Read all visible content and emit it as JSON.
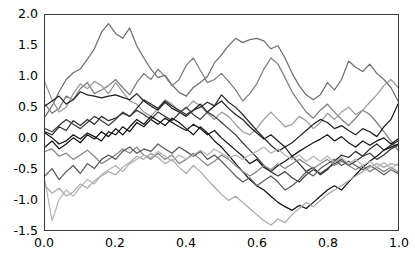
{
  "chart_data": {
    "type": "line",
    "title": "",
    "subtitle": "",
    "xlabel": "",
    "ylabel": "",
    "xlim": [
      0.0,
      1.0
    ],
    "ylim": [
      -1.5,
      2.0
    ],
    "grid": false,
    "legend": null,
    "legend_position": "none",
    "xticks": [
      "0.0",
      "0.2",
      "0.4",
      "0.6",
      "0.8",
      "1.0"
    ],
    "xtick_values": [
      0.0,
      0.2,
      0.4,
      0.6,
      0.8,
      1.0
    ],
    "yticks": [
      "2.0",
      "1.5",
      "1.0",
      "0.5",
      "0.0",
      "-0.5",
      "-1.0",
      "-1.5"
    ],
    "ytick_values": [
      2.0,
      1.5,
      1.0,
      0.5,
      0.0,
      -0.5,
      -1.0,
      -1.5
    ],
    "x": [
      0.0,
      0.02,
      0.04,
      0.06,
      0.08,
      0.1,
      0.12,
      0.14,
      0.16,
      0.18,
      0.2,
      0.22,
      0.24,
      0.26,
      0.28,
      0.3,
      0.32,
      0.34,
      0.36,
      0.38,
      0.4,
      0.42,
      0.44,
      0.46,
      0.48,
      0.5,
      0.52,
      0.54,
      0.56,
      0.58,
      0.6,
      0.62,
      0.64,
      0.66,
      0.68,
      0.7,
      0.72,
      0.74,
      0.76,
      0.78,
      0.8,
      0.82,
      0.84,
      0.86,
      0.88,
      0.9,
      0.92,
      0.94,
      0.96,
      0.98,
      1.0
    ],
    "series": [
      {
        "name": "sample-1",
        "color": "#6e6e6e",
        "values": [
          0.34,
          0.52,
          0.75,
          0.95,
          1.06,
          1.12,
          1.28,
          1.45,
          1.72,
          1.86,
          1.7,
          1.62,
          1.79,
          1.5,
          1.3,
          1.12,
          0.98,
          1.02,
          0.86,
          0.74,
          0.68,
          0.82,
          0.9,
          1.0,
          1.22,
          1.35,
          1.5,
          1.62,
          1.55,
          1.6,
          1.62,
          1.58,
          1.45,
          1.5,
          1.3,
          1.05,
          0.85,
          0.7,
          0.62,
          0.7,
          0.9,
          0.78,
          0.95,
          1.25,
          1.15,
          1.08,
          1.2,
          1.05,
          0.95,
          0.82,
          0.6
        ]
      },
      {
        "name": "sample-2",
        "color": "#7d7d7d",
        "values": [
          0.55,
          0.4,
          0.48,
          0.68,
          0.62,
          0.8,
          0.9,
          0.72,
          0.78,
          0.85,
          0.95,
          0.82,
          0.7,
          0.9,
          1.05,
          0.95,
          1.12,
          1.0,
          0.85,
          0.95,
          1.18,
          1.3,
          1.1,
          0.9,
          0.95,
          1.05,
          0.92,
          0.78,
          0.6,
          0.72,
          0.88,
          1.12,
          1.3,
          1.2,
          0.98,
          0.75,
          0.58,
          0.42,
          0.32,
          0.45,
          0.55,
          0.42,
          0.3,
          0.2,
          0.32,
          0.45,
          0.38,
          0.25,
          0.1,
          -0.05,
          -0.2
        ]
      },
      {
        "name": "sample-3",
        "color": "#9a9a9a",
        "values": [
          0.9,
          0.62,
          0.42,
          0.5,
          0.72,
          0.88,
          0.8,
          0.92,
          0.85,
          0.72,
          0.9,
          0.75,
          0.6,
          0.55,
          0.42,
          0.35,
          0.48,
          0.62,
          0.55,
          0.42,
          0.48,
          0.6,
          0.52,
          0.4,
          0.3,
          0.42,
          0.35,
          0.22,
          0.1,
          0.05,
          0.15,
          0.3,
          0.42,
          0.3,
          0.18,
          0.22,
          0.35,
          0.28,
          0.15,
          0.25,
          0.4,
          0.3,
          0.42,
          0.5,
          0.38,
          0.45,
          0.58,
          0.7,
          0.85,
          0.95,
          0.82
        ]
      },
      {
        "name": "sample-4",
        "color": "#1f1f1f",
        "values": [
          0.52,
          0.6,
          0.68,
          0.55,
          0.62,
          0.75,
          0.7,
          0.68,
          0.65,
          0.68,
          0.7,
          0.66,
          0.62,
          0.72,
          0.6,
          0.52,
          0.45,
          0.58,
          0.48,
          0.42,
          0.35,
          0.45,
          0.55,
          0.42,
          0.52,
          0.6,
          0.48,
          0.38,
          0.3,
          0.18,
          0.08,
          -0.02,
          0.05,
          -0.05,
          -0.15,
          -0.08,
          0.02,
          0.12,
          0.22,
          0.3,
          0.25,
          0.15,
          0.2,
          0.12,
          0.05,
          0.15,
          0.1,
          0.02,
          0.18,
          0.3,
          0.55
        ]
      },
      {
        "name": "sample-5",
        "color": "#2b2b2b",
        "values": [
          0.1,
          0.05,
          0.18,
          0.12,
          0.28,
          0.2,
          0.3,
          0.22,
          0.35,
          0.28,
          0.32,
          0.4,
          0.35,
          0.48,
          0.62,
          0.55,
          0.48,
          0.6,
          0.52,
          0.45,
          0.38,
          0.45,
          0.5,
          0.58,
          0.52,
          0.7,
          0.58,
          0.5,
          0.38,
          0.25,
          0.12,
          0.0,
          -0.12,
          -0.22,
          -0.15,
          -0.3,
          -0.42,
          -0.55,
          -0.48,
          -0.6,
          -0.52,
          -0.38,
          -0.28,
          -0.32,
          -0.22,
          -0.3,
          -0.18,
          -0.1,
          -0.2,
          -0.12,
          -0.05
        ]
      },
      {
        "name": "sample-6",
        "color": "#141414",
        "values": [
          0.08,
          0.0,
          -0.1,
          -0.05,
          0.05,
          -0.02,
          0.08,
          0.02,
          -0.05,
          0.1,
          0.05,
          0.18,
          0.1,
          0.25,
          0.18,
          0.3,
          0.22,
          0.32,
          0.25,
          0.18,
          0.12,
          0.22,
          0.15,
          0.05,
          0.12,
          0.0,
          -0.1,
          -0.2,
          -0.3,
          -0.42,
          -0.35,
          -0.48,
          -0.55,
          -0.45,
          -0.38,
          -0.3,
          -0.22,
          -0.15,
          -0.08,
          -0.02,
          0.05,
          -0.05,
          0.02,
          -0.08,
          -0.15,
          -0.05,
          -0.12,
          -0.05,
          0.0,
          -0.1,
          -0.02
        ]
      },
      {
        "name": "sample-7",
        "color": "#3d3d3d",
        "values": [
          0.15,
          0.1,
          0.2,
          0.3,
          0.22,
          0.15,
          0.25,
          0.35,
          0.28,
          0.2,
          0.3,
          0.42,
          0.35,
          0.45,
          0.38,
          0.3,
          0.42,
          0.35,
          0.28,
          0.4,
          0.5,
          0.38,
          0.3,
          0.42,
          0.35,
          0.25,
          0.15,
          0.05,
          -0.08,
          -0.2,
          -0.32,
          -0.45,
          -0.55,
          -0.62,
          -0.55,
          -0.65,
          -0.72,
          -0.6,
          -0.52,
          -0.58,
          -0.5,
          -0.42,
          -0.35,
          -0.45,
          -0.38,
          -0.3,
          -0.25,
          -0.35,
          -0.28,
          -0.18,
          -0.12
        ]
      },
      {
        "name": "sample-8",
        "color": "#0f0f0f",
        "values": [
          -0.15,
          -0.05,
          -0.18,
          -0.1,
          0.0,
          -0.08,
          0.05,
          -0.02,
          0.1,
          0.02,
          0.15,
          0.05,
          0.18,
          0.3,
          0.22,
          0.35,
          0.28,
          0.2,
          0.32,
          0.25,
          0.15,
          0.05,
          0.18,
          0.08,
          -0.05,
          -0.15,
          -0.28,
          -0.42,
          -0.55,
          -0.68,
          -0.78,
          -0.85,
          -0.95,
          -1.05,
          -1.12,
          -1.18,
          -1.1,
          -1.15,
          -1.05,
          -0.95,
          -0.85,
          -0.78,
          -0.85,
          -0.72,
          -0.6,
          -0.48,
          -0.38,
          -0.3,
          -0.2,
          -0.15,
          -0.1
        ]
      },
      {
        "name": "sample-9",
        "color": "#858585",
        "values": [
          -0.22,
          -0.18,
          -0.3,
          -0.25,
          -0.35,
          -0.28,
          -0.2,
          -0.3,
          -0.42,
          -0.35,
          -0.28,
          -0.18,
          -0.25,
          -0.15,
          -0.28,
          -0.35,
          -0.25,
          -0.35,
          -0.28,
          -0.42,
          -0.35,
          -0.25,
          -0.35,
          -0.45,
          -0.38,
          -0.28,
          -0.35,
          -0.45,
          -0.55,
          -0.62,
          -0.55,
          -0.45,
          -0.52,
          -0.42,
          -0.5,
          -0.42,
          -0.35,
          -0.42,
          -0.5,
          -0.42,
          -0.35,
          -0.45,
          -0.38,
          -0.45,
          -0.52,
          -0.45,
          -0.55,
          -0.48,
          -0.55,
          -0.48,
          -0.55
        ]
      },
      {
        "name": "sample-10",
        "color": "#5a5a5a",
        "values": [
          -0.62,
          -0.5,
          -0.68,
          -0.55,
          -0.45,
          -0.58,
          -0.42,
          -0.5,
          -0.35,
          -0.28,
          -0.35,
          -0.22,
          -0.15,
          -0.25,
          -0.18,
          -0.22,
          -0.1,
          -0.18,
          -0.25,
          -0.15,
          -0.22,
          -0.3,
          -0.22,
          -0.35,
          -0.28,
          -0.38,
          -0.5,
          -0.62,
          -0.72,
          -0.65,
          -0.78,
          -0.7,
          -0.62,
          -0.72,
          -0.85,
          -0.78,
          -0.68,
          -0.55,
          -0.62,
          -0.5,
          -0.42,
          -0.35,
          -0.45,
          -0.38,
          -0.45,
          -0.52,
          -0.45,
          -0.52,
          -0.6,
          -0.52,
          -0.58
        ]
      },
      {
        "name": "sample-11",
        "color": "#a8a8a8",
        "values": [
          -0.78,
          -0.9,
          -0.82,
          -0.95,
          -0.88,
          -0.75,
          -0.82,
          -0.7,
          -0.62,
          -0.55,
          -0.6,
          -0.48,
          -0.4,
          -0.3,
          -0.35,
          -0.25,
          -0.32,
          -0.42,
          -0.35,
          -0.48,
          -0.58,
          -0.45,
          -0.55,
          -0.68,
          -0.8,
          -0.92,
          -1.02,
          -0.95,
          -1.05,
          -1.15,
          -1.25,
          -1.35,
          -1.42,
          -1.32,
          -1.38,
          -1.25,
          -1.15,
          -1.05,
          -1.12,
          -1.02,
          -0.92,
          -0.85,
          -0.78,
          -0.7,
          -0.62,
          -0.55,
          -0.48,
          -0.42,
          -0.48,
          -0.42,
          -0.45
        ]
      },
      {
        "name": "sample-12",
        "color": "#b5b5b5",
        "values": [
          -0.7,
          -1.35,
          -1.0,
          -0.85,
          -0.95,
          -0.8,
          -0.68,
          -0.75,
          -0.6,
          -0.52,
          -0.45,
          -0.55,
          -0.42,
          -0.35,
          -0.28,
          -0.32,
          -0.22,
          -0.3,
          -0.38,
          -0.28,
          -0.35,
          -0.28,
          -0.2,
          -0.28,
          -0.18,
          -0.25,
          -0.32,
          -0.28,
          -0.35,
          -0.28,
          -0.22,
          -0.15,
          -0.25,
          -0.18,
          -0.28,
          -0.35,
          -0.28,
          -0.38,
          -0.3,
          -0.38,
          -0.3,
          -0.4,
          -0.32,
          -0.42,
          -0.35,
          -0.45,
          -0.38,
          -0.48,
          -0.4,
          -0.5,
          -0.42
        ]
      }
    ]
  },
  "axes": {
    "frame_color": "#3a3a3a",
    "tick_label_color": "#000000",
    "background": "#ffffff"
  }
}
